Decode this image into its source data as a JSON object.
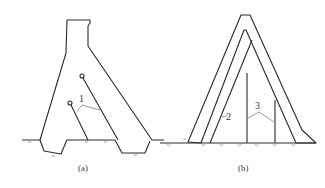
{
  "figure": {
    "panels": [
      {
        "id": "a",
        "caption": "(a)",
        "callouts": [
          {
            "label": "1",
            "target": "tie-rods"
          }
        ]
      },
      {
        "id": "b",
        "caption": "(b)",
        "callouts": [
          {
            "label": "2",
            "target": "inner-wall-line"
          },
          {
            "label": "3",
            "target": "vertical-members"
          }
        ]
      }
    ],
    "colors": {
      "line": "#2a2a2a",
      "fill_stipple": "#8a8a8a",
      "background": "#ffffff"
    }
  }
}
